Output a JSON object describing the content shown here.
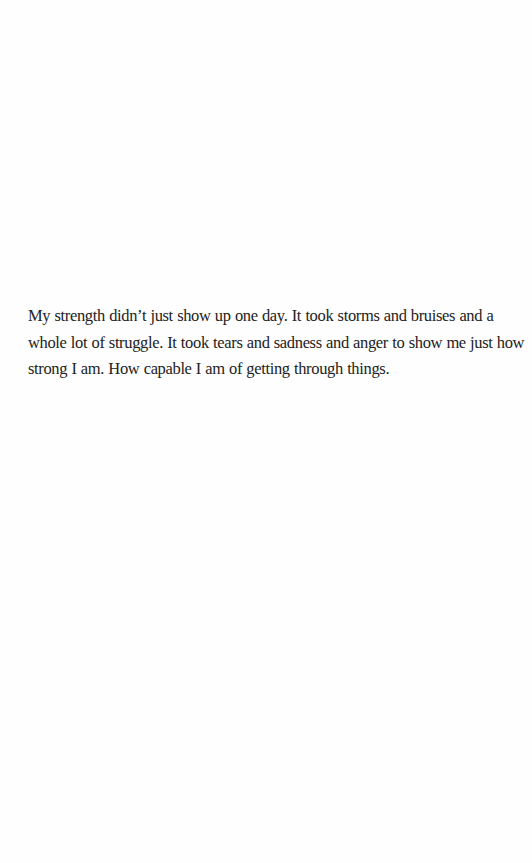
{
  "page": {
    "background": "#fefefe",
    "text_color": "#222222"
  },
  "quote": {
    "lines": [
      "My strength didn’t just show up one day. It took storms and bruises and a",
      "whole lot of struggle. It took tears and sadness and anger to show me just how",
      "strong I am. How capable I am of getting through things."
    ]
  }
}
